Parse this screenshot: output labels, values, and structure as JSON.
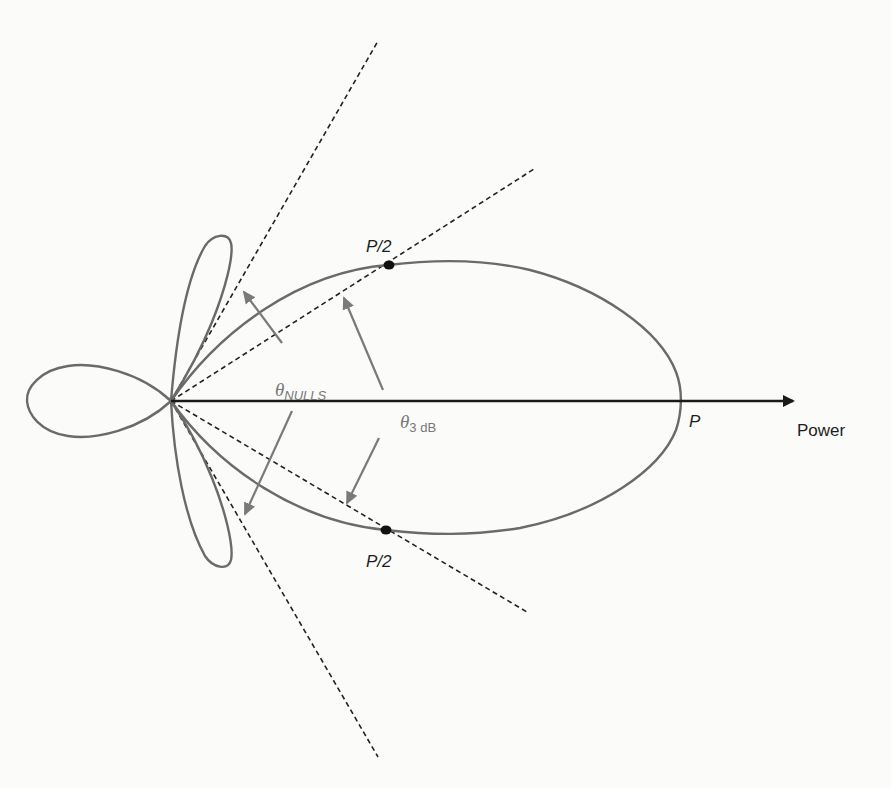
{
  "diagram": {
    "type": "antenna-radiation-pattern",
    "labels": {
      "half_power_upper": "P/2",
      "half_power_lower": "P/2",
      "peak": "P",
      "axis": "Power",
      "theta_nulls_symbol": "θ",
      "theta_nulls_sub": "NULLS",
      "theta_3db_symbol": "θ",
      "theta_3db_sub": "3 dB"
    },
    "colors": {
      "lobe": "#6a6a6a",
      "axis": "#1a1a1a",
      "dashed_lines": "#222222",
      "pointer_arrows": "#7a7a7a",
      "dots": "#111111"
    },
    "elements": {
      "main_lobe": "Main beam lobe extending to peak P",
      "side_lobes": [
        "upper side lobe",
        "lower side lobe"
      ],
      "back_lobe": "Back lobe",
      "null_lines": [
        "upper null direction",
        "lower null direction"
      ],
      "half_power_lines": [
        "upper 3 dB direction",
        "lower 3 dB direction"
      ]
    }
  }
}
